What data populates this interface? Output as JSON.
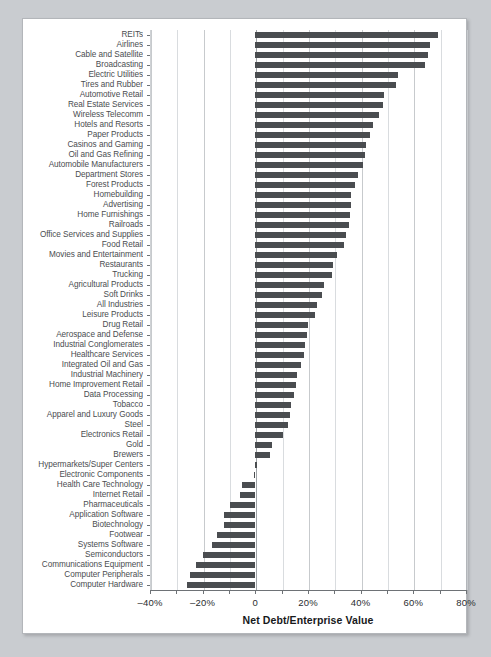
{
  "chart_data": {
    "type": "bar",
    "orientation": "horizontal",
    "title": "",
    "xlabel": "Net Debt/Enterprise Value",
    "ylabel": "",
    "xlim": [
      -40,
      80
    ],
    "xticks": [
      -40,
      -20,
      0,
      20,
      40,
      60,
      80
    ],
    "xticklabels": [
      "–40%",
      "–20%",
      "0",
      "20%",
      "40%",
      "60%",
      "80%"
    ],
    "minor_tick_step": 10,
    "grid": true,
    "grid_axis": "x",
    "legend": null,
    "bar_color": "#4a4d50",
    "categories": [
      "REITs",
      "Airlines",
      "Cable and Satellite",
      "Broadcasting",
      "Electric Utilities",
      "Tires and Rubber",
      "Automotive Retail",
      "Real Estate Services",
      "Wireless Telecomm",
      "Hotels and Resorts",
      "Paper Products",
      "Casinos and Gaming",
      "Oil and Gas Refining",
      "Automobile Manufacturers",
      "Department Stores",
      "Forest Products",
      "Homebuilding",
      "Advertising",
      "Home Furnishings",
      "Railroads",
      "Office Services and Supplies",
      "Food Retail",
      "Movies and Entertainment",
      "Restaurants",
      "Trucking",
      "Agricultural Products",
      "Soft Drinks",
      "All Industries",
      "Leisure Products",
      "Drug Retail",
      "Aerospace and Defense",
      "Industrial Conglomerates",
      "Healthcare Services",
      "Integrated Oil and Gas",
      "Industrial Machinery",
      "Home Improvement Retail",
      "Data Processing",
      "Tobacco",
      "Apparel and Luxury Goods",
      "Steel",
      "Electronics Retail",
      "Gold",
      "Brewers",
      "Hypermarkets/Super Centers",
      "Electronic Components",
      "Health Care Technology",
      "Internet Retail",
      "Pharmaceuticals",
      "Application Software",
      "Biotechnology",
      "Footwear",
      "Systems Software",
      "Semiconductors",
      "Communications Equipment",
      "Computer Peripherals",
      "Computer Hardware"
    ],
    "values": [
      69.5,
      66.5,
      65.5,
      64.5,
      54.0,
      53.5,
      49.0,
      48.5,
      47.0,
      44.5,
      43.5,
      42.0,
      41.5,
      41.0,
      39.0,
      38.0,
      36.5,
      36.5,
      36.0,
      35.5,
      34.5,
      33.5,
      31.0,
      29.5,
      29.0,
      26.0,
      25.5,
      23.5,
      22.5,
      20.0,
      19.5,
      19.0,
      18.5,
      17.5,
      16.0,
      15.5,
      14.5,
      13.5,
      13.0,
      12.5,
      10.5,
      6.5,
      5.5,
      0.5,
      -0.5,
      -5.0,
      -6.0,
      -9.5,
      -12.0,
      -12.0,
      -14.5,
      -16.5,
      -20.0,
      -22.5,
      -25.0,
      -26.0
    ]
  }
}
